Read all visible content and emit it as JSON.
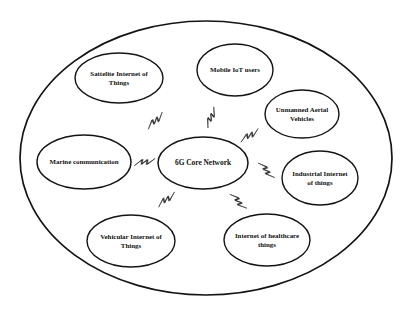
{
  "diagram": {
    "boundary": {
      "name": "outer-boundary-ellipse",
      "cx": 206,
      "cy": 158,
      "rx": 186,
      "ry": 137
    },
    "center_node": {
      "id": "core",
      "label_line1": "6G Core Network",
      "label_line2": "",
      "cx": 203,
      "cy": 163,
      "rx": 45,
      "ry": 26,
      "font_size": 7.4
    },
    "nodes": [
      {
        "id": "satellite-internet-of-things",
        "label_line1": "Sattelite Internet of",
        "label_line2": "Things",
        "cx": 119,
        "cy": 78,
        "rx": 44,
        "ry": 25,
        "font_size": 6.9
      },
      {
        "id": "mobile-iot-users",
        "label_line1": "Mobile IoT users",
        "label_line2": "",
        "cx": 235,
        "cy": 70,
        "rx": 38,
        "ry": 26,
        "font_size": 6.9
      },
      {
        "id": "unmanned-aerial-vehicles",
        "label_line1": "Unmanned Aerial",
        "label_line2": "Vehicles",
        "cx": 302,
        "cy": 114,
        "rx": 37,
        "ry": 24,
        "font_size": 6.9
      },
      {
        "id": "industrial-internet-of-things",
        "label_line1": "Industrial Internet",
        "label_line2": "of things",
        "cx": 320,
        "cy": 178,
        "rx": 38,
        "ry": 27,
        "font_size": 6.9
      },
      {
        "id": "internet-of-healthcare-things",
        "label_line1": "Internet of healthcare",
        "label_line2": "things",
        "cx": 267,
        "cy": 240,
        "rx": 43,
        "ry": 26,
        "font_size": 6.9
      },
      {
        "id": "vehicular-internet-of-things",
        "label_line1": "Vehicular Internet of",
        "label_line2": "Things",
        "cx": 131,
        "cy": 241,
        "rx": 44,
        "ry": 26,
        "font_size": 6.9
      },
      {
        "id": "marine-communication",
        "label_line1": "Marine communication",
        "label_line2": "",
        "cx": 84,
        "cy": 162,
        "rx": 47,
        "ry": 27,
        "font_size": 6.9
      }
    ],
    "connectors": [
      {
        "id": "connector-satellite-internet-of-things",
        "cx": 157,
        "cy": 122,
        "angle": -52,
        "scale": 1.0
      },
      {
        "id": "connector-mobile-iot-users",
        "cx": 213,
        "cy": 118,
        "angle": -76,
        "scale": 1.0
      },
      {
        "id": "connector-unmanned-aerial-vehicles",
        "cx": 251,
        "cy": 137,
        "angle": -40,
        "scale": 1.0
      },
      {
        "id": "connector-industrial-internet-of-things",
        "cx": 265,
        "cy": 172,
        "angle": 40,
        "scale": 1.0
      },
      {
        "id": "connector-internet-of-healthcare-things",
        "cx": 237,
        "cy": 203,
        "angle": 38,
        "scale": 1.0
      },
      {
        "id": "connector-vehicular-internet-of-things",
        "cx": 165,
        "cy": 198,
        "angle": 135,
        "scale": 1.0
      },
      {
        "id": "connector-marine-communication",
        "cx": 144,
        "cy": 160,
        "angle": 160,
        "scale": 1.0
      }
    ],
    "colors": {
      "stroke": "#141414",
      "bolt": "#2a2a2a",
      "background": "#ffffff",
      "text": "#111111"
    }
  }
}
